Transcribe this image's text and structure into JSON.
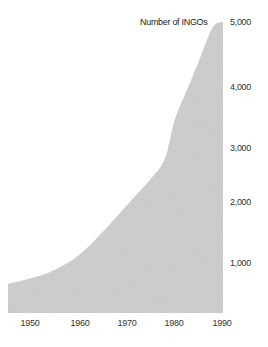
{
  "chart_data": {
    "type": "area",
    "title": "",
    "series_label": "Number of INGOs",
    "xlabel": "",
    "ylabel": "",
    "x": [
      1945,
      1950,
      1955,
      1960,
      1965,
      1970,
      1975,
      1978,
      1980,
      1983,
      1985,
      1988,
      1990
    ],
    "series": [
      {
        "name": "Number of INGOs",
        "values": [
          500,
          600,
          750,
          1000,
          1400,
          1850,
          2300,
          2650,
          3300,
          3900,
          4300,
          4900,
          5000
        ]
      }
    ],
    "xlim": [
      1945,
      1990
    ],
    "ylim": [
      0,
      5000
    ],
    "x_ticks": [
      "1950",
      "1960",
      "1970",
      "1980",
      "1990"
    ],
    "y_ticks": [
      "1,000",
      "2,000",
      "3,000",
      "4,000",
      "5,000"
    ],
    "y_axis_position": "right",
    "grid": false,
    "legend": "none",
    "fill_color": "#c8c8c8"
  }
}
